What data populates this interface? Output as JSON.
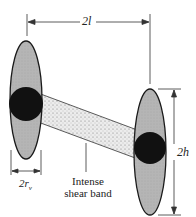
{
  "diagram": {
    "type": "dislocation-loop / shear band schematic",
    "labels": {
      "top_dimension": "2l",
      "height_dimension": "2h",
      "radius_dimension_prefix": "2r",
      "radius_dimension_sub": "v",
      "band_label_line1": "Intense",
      "band_label_line2": "shear band"
    },
    "colors": {
      "ellipse_fill": "#b8b8b8",
      "ellipse_stroke": "#1a1a1a",
      "void_fill": "#111111",
      "band_fill": "#e6e6e6",
      "line": "#333333"
    },
    "elements": [
      {
        "name": "left-ellipse",
        "cx": 26,
        "cy": 100,
        "rx": 16,
        "ry": 59
      },
      {
        "name": "right-ellipse",
        "cx": 150,
        "cy": 152,
        "rx": 16,
        "ry": 63
      },
      {
        "name": "left-void",
        "cx": 26,
        "cy": 104,
        "r": 17
      },
      {
        "name": "right-void",
        "cx": 150,
        "cy": 148,
        "r": 16
      }
    ]
  }
}
